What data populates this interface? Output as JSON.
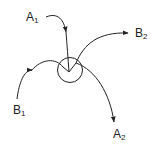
{
  "diagram": {
    "labels": {
      "a1": {
        "letter": "A",
        "sub": "1"
      },
      "a2": {
        "letter": "A",
        "sub": "2"
      },
      "b1": {
        "letter": "B",
        "sub": "1"
      },
      "b2": {
        "letter": "B",
        "sub": "2"
      }
    },
    "paths": [
      {
        "id": "A1-in",
        "from": "A1",
        "to": "center"
      },
      {
        "id": "B2-out",
        "from": "center",
        "to": "B2"
      },
      {
        "id": "B1-in",
        "from": "B1",
        "to": "center"
      },
      {
        "id": "A2-out",
        "from": "center",
        "to": "A2"
      }
    ],
    "node": {
      "shape": "circle"
    },
    "colors": {
      "stroke": "#222222",
      "background": "#ffffff"
    }
  }
}
